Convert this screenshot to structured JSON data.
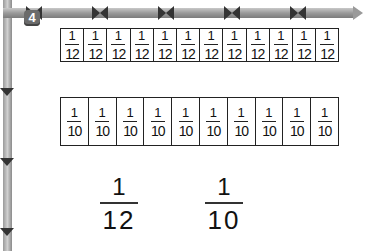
{
  "problem": {
    "number": "4",
    "twelfths_strip": {
      "count": 12,
      "cells": [
        {
          "numerator": "1",
          "denominator": "12"
        },
        {
          "numerator": "1",
          "denominator": "12"
        },
        {
          "numerator": "1",
          "denominator": "12"
        },
        {
          "numerator": "1",
          "denominator": "12"
        },
        {
          "numerator": "1",
          "denominator": "12"
        },
        {
          "numerator": "1",
          "denominator": "12"
        },
        {
          "numerator": "1",
          "denominator": "12"
        },
        {
          "numerator": "1",
          "denominator": "12"
        },
        {
          "numerator": "1",
          "denominator": "12"
        },
        {
          "numerator": "1",
          "denominator": "12"
        },
        {
          "numerator": "1",
          "denominator": "12"
        },
        {
          "numerator": "1",
          "denominator": "12"
        }
      ]
    },
    "tenths_strip": {
      "count": 10,
      "cells": [
        {
          "numerator": "1",
          "denominator": "10"
        },
        {
          "numerator": "1",
          "denominator": "10"
        },
        {
          "numerator": "1",
          "denominator": "10"
        },
        {
          "numerator": "1",
          "denominator": "10"
        },
        {
          "numerator": "1",
          "denominator": "10"
        },
        {
          "numerator": "1",
          "denominator": "10"
        },
        {
          "numerator": "1",
          "denominator": "10"
        },
        {
          "numerator": "1",
          "denominator": "10"
        },
        {
          "numerator": "1",
          "denominator": "10"
        },
        {
          "numerator": "1",
          "denominator": "10"
        }
      ]
    },
    "compare": [
      {
        "numerator": "1",
        "denominator": "12"
      },
      {
        "numerator": "1",
        "denominator": "10"
      }
    ]
  },
  "colors": {
    "frame": "#9a9a9a",
    "badge": "#6b6b6b",
    "ink": "#111111"
  }
}
